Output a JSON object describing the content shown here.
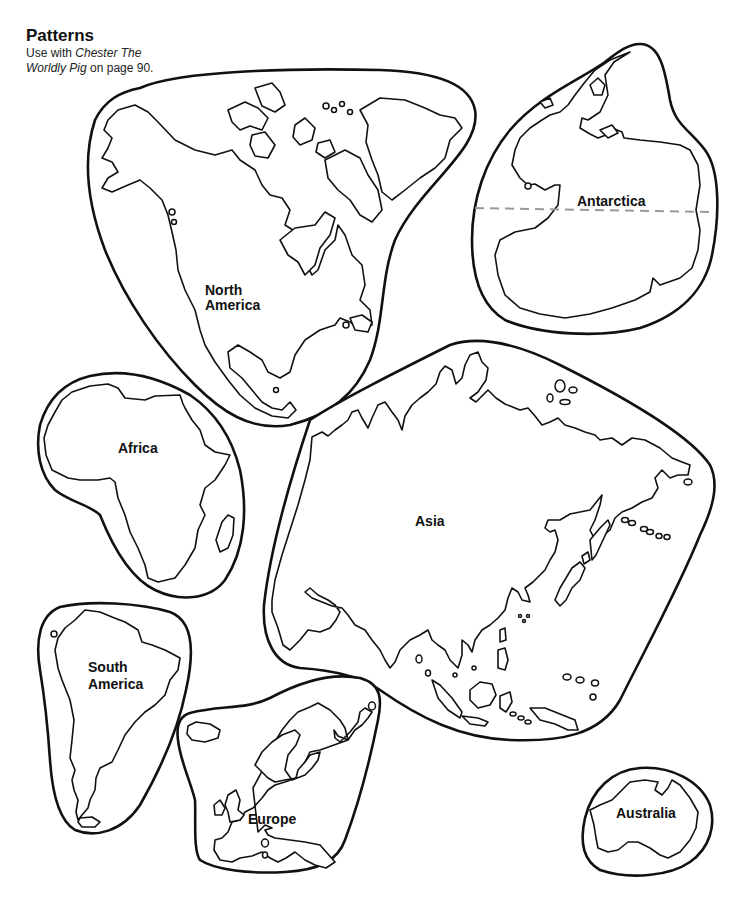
{
  "header": {
    "title": "Patterns",
    "subtitle_prefix": "Use with ",
    "subtitle_book": "Chester The Worldly Pig",
    "subtitle_suffix": " on page 90."
  },
  "continents": [
    {
      "id": "north-america",
      "label_line1": "North",
      "label_line2": "America"
    },
    {
      "id": "antarctica",
      "label": "Antarctica"
    },
    {
      "id": "africa",
      "label": "Africa"
    },
    {
      "id": "asia",
      "label": "Asia"
    },
    {
      "id": "south-america",
      "label_line1": "South",
      "label_line2": "America"
    },
    {
      "id": "europe",
      "label": "Europe"
    },
    {
      "id": "australia",
      "label": "Australia"
    }
  ],
  "colors": {
    "outline": "#111111",
    "background": "#ffffff",
    "cut_line": "#999999"
  }
}
